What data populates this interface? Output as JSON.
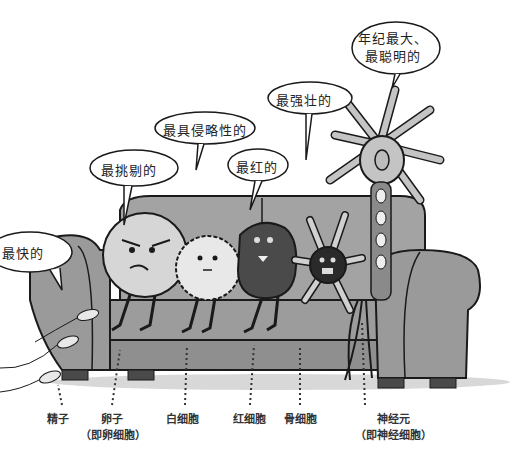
{
  "bubbles": {
    "neuron": {
      "line1": "年纪最大、",
      "line2": "最聪明的"
    },
    "bone": "最强壮的",
    "white_blood": "最具侵略性的",
    "egg": "最挑剔的",
    "red_blood": "最红的",
    "sperm": "最快的"
  },
  "labels": {
    "sperm": {
      "name": "精子"
    },
    "egg": {
      "name": "卵子",
      "sub": "（即卵细胞）"
    },
    "white_blood": {
      "name": "白细胞"
    },
    "red_blood": {
      "name": "红细胞"
    },
    "bone": {
      "name": "骨细胞"
    },
    "neuron": {
      "name": "神经元",
      "sub": "（即神经细胞）"
    }
  },
  "colors": {
    "couch": "#9a9a9a",
    "couch_dark": "#7d7d7d",
    "outline": "#1a1a1a",
    "egg": "#d6d6d6",
    "white_blood": "#e6e6e6",
    "red_blood": "#4a4a4a",
    "bone": "#2a2a2a",
    "neuron": "#bdbdbd"
  }
}
